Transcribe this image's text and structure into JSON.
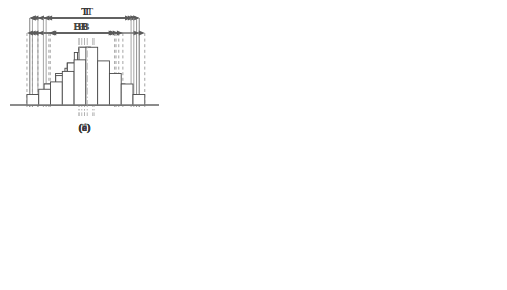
{
  "figure": {
    "title": "",
    "panel_count": 6,
    "columns": 3,
    "rows": 2,
    "label_tolerance": "T",
    "label_spread": "B",
    "colors": {
      "bar_stroke": "#4a4a4a",
      "bar_fill": "#ffffff",
      "baseline": "#8a8a8a",
      "dimension_line": "#5a5a5a",
      "boundary_solid": "#9a9a9a",
      "boundary_dashed": "#9a9a9a",
      "center_line": "#b0b0b0",
      "text": "#3a3a3a",
      "background": "#ffffff"
    }
  },
  "chart_data": {
    "type": "bar",
    "xlabel": "",
    "ylabel": "",
    "grid": false,
    "legend": false,
    "shared_labels": {
      "tolerance": "T",
      "spread": "B"
    },
    "panels": [
      {
        "id": "a",
        "caption": "(a)",
        "bar_count": 7,
        "values": [
          1,
          2,
          3.5,
          5,
          3.5,
          2,
          1
        ],
        "ymax": 6,
        "bar_left": 0.28,
        "bar_right": 0.72,
        "tolerance_left": 0.12,
        "tolerance_right": 0.88,
        "spread_left": 0.25,
        "spread_right": 0.75,
        "tolerance_line_style": "solid",
        "spread_line_style": "dashed",
        "center_lines": [
          0.5
        ],
        "note": "B well inside T, centered"
      },
      {
        "id": "b",
        "caption": "(b)",
        "bar_count": 7,
        "values": [
          1,
          2,
          3.5,
          5,
          3,
          2,
          1
        ],
        "ymax": 6,
        "bar_left": 0.22,
        "bar_right": 0.7,
        "tolerance_left": 0.16,
        "tolerance_right": 0.88,
        "spread_left": 0.16,
        "spread_right": 0.73,
        "tolerance_line_style": "solid",
        "spread_line_style": "dashed",
        "center_lines": [
          0.46,
          0.56
        ],
        "note": "B inside T but shifted left of tolerance centre"
      },
      {
        "id": "c",
        "caption": "(c)",
        "bar_count": 9,
        "values": [
          1,
          2,
          3,
          4,
          5.5,
          4,
          2.5,
          2,
          1
        ],
        "ymax": 6,
        "bar_left": 0.12,
        "bar_right": 0.88,
        "tolerance_left": 0.1,
        "tolerance_right": 0.9,
        "spread_left": 0.1,
        "spread_right": 0.9,
        "tolerance_line_style": "solid",
        "spread_line_style": "solid",
        "center_lines": [
          0.5
        ],
        "note": "B essentially equal to T"
      },
      {
        "id": "d",
        "caption": "(d)",
        "bar_count": 7,
        "values": [
          1,
          2,
          3.5,
          5,
          3.5,
          2,
          1
        ],
        "ymax": 6,
        "bar_left": 0.26,
        "bar_right": 0.7,
        "tolerance_left": 0.1,
        "tolerance_right": 0.9,
        "spread_left": 0.24,
        "spread_right": 0.72,
        "tolerance_line_style": "solid",
        "spread_line_style": "dashed",
        "center_lines": [
          0.48
        ],
        "note": "B inside T, offset toward left of tolerance band"
      },
      {
        "id": "e",
        "caption": "(e)",
        "bar_count": 8,
        "values": [
          1,
          2,
          2.8,
          4,
          5.5,
          4,
          2.8,
          1.2
        ],
        "ymax": 6,
        "bar_left": 0.12,
        "bar_right": 0.8,
        "tolerance_left": 0.22,
        "tolerance_right": 0.86,
        "spread_left": 0.12,
        "spread_right": 0.78,
        "tolerance_line_style": "solid",
        "spread_line_style": "dashed",
        "center_lines": [
          0.46,
          0.57
        ],
        "note": "B extends past left limit of T"
      },
      {
        "id": "f",
        "caption": "(f)",
        "bar_count": 10,
        "values": [
          1,
          1.5,
          2.2,
          3.2,
          4.3,
          5.5,
          4.2,
          3,
          2,
          1
        ],
        "ymax": 6,
        "bar_left": 0.08,
        "bar_right": 0.94,
        "tolerance_left": 0.2,
        "tolerance_right": 0.84,
        "spread_left": 0.08,
        "spread_right": 0.94,
        "tolerance_line_style": "solid",
        "spread_line_style": "dashed",
        "center_lines": [
          0.52
        ],
        "note": "B wider than T on both sides"
      }
    ]
  }
}
